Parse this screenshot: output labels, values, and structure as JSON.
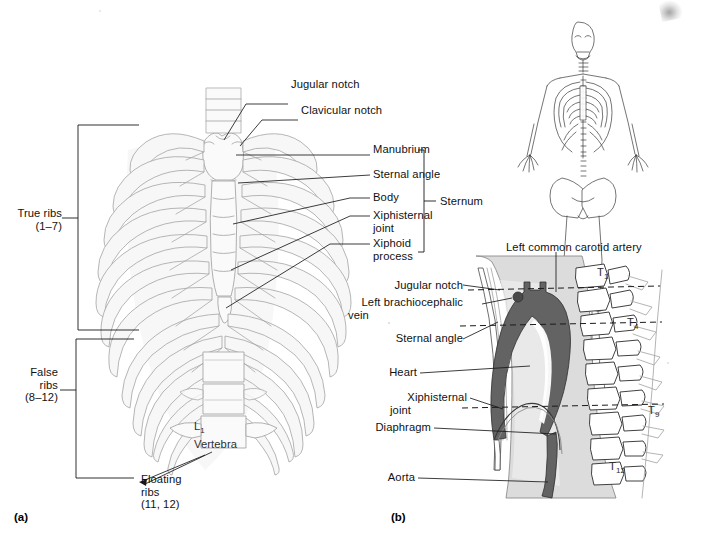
{
  "figure": {
    "panels": [
      {
        "id": "a",
        "label": "(a)",
        "caption": "Anterior view of the bony thorax"
      },
      {
        "id": "b",
        "label": "(b)",
        "caption": "Midsagittal section of the thorax"
      }
    ]
  },
  "panel_a": {
    "label": "(a)",
    "brackets": [
      {
        "name": "true-ribs",
        "label_line1": "True ribs",
        "label_line2": "(1–7)"
      },
      {
        "name": "false-ribs",
        "label_line1": "False",
        "label_line2": "ribs",
        "label_line3": "(8–12)"
      },
      {
        "name": "sternum",
        "label": "Sternum"
      }
    ],
    "callouts": [
      {
        "name": "jugular-notch",
        "text": "Jugular notch"
      },
      {
        "name": "clavicular-notch",
        "text": "Clavicular notch"
      },
      {
        "name": "manubrium",
        "text": "Manubrium"
      },
      {
        "name": "sternal-angle",
        "text": "Sternal angle"
      },
      {
        "name": "body",
        "text": "Body"
      },
      {
        "name": "xiphisternal-joint",
        "line1": "Xiphisternal",
        "line2": "joint"
      },
      {
        "name": "xiphoid-process",
        "line1": "Xiphoid",
        "line2": "process"
      },
      {
        "name": "floating-ribs",
        "line1": "Floating",
        "line2": "ribs",
        "line3": "(11, 12)"
      }
    ],
    "vertebra": {
      "name": "l1-vertebra",
      "symbol": "L",
      "subscript": "1",
      "word": "Vertebra"
    }
  },
  "panel_b": {
    "label": "(b)",
    "callouts": [
      {
        "name": "left-common-carotid-artery",
        "text": "Left common carotid artery"
      },
      {
        "name": "jugular-notch",
        "text": "Jugular notch"
      },
      {
        "name": "left-brachiocephalic-vein",
        "line1": "Left brachiocephalic",
        "line2": "vein"
      },
      {
        "name": "sternal-angle",
        "text": "Sternal angle"
      },
      {
        "name": "heart",
        "text": "Heart"
      },
      {
        "name": "xiphisternal-joint",
        "line1": "Xiphisternal",
        "line2": "joint"
      },
      {
        "name": "diaphragm",
        "text": "Diaphragm"
      },
      {
        "name": "aorta",
        "text": "Aorta"
      }
    ],
    "vertebrae": [
      {
        "name": "vertebra-t1",
        "symbol": "T",
        "subscript": "1"
      },
      {
        "name": "vertebra-t4",
        "symbol": "T",
        "subscript": "4"
      },
      {
        "name": "vertebra-t9",
        "symbol": "T",
        "subscript": "9"
      },
      {
        "name": "vertebra-t12",
        "symbol": "T",
        "subscript": "12"
      }
    ],
    "reference_lines": 3
  },
  "orientation_figure": {
    "name": "skeleton-orientation-figure",
    "view": "anterior full skeleton"
  },
  "colors": {
    "ink": "#111111",
    "bone_outline": "#9a9a9a",
    "bone_fill": "#f4f4f4",
    "soft_tissue": "#d9d9d9",
    "heart_aorta": "#636363",
    "background": "#ffffff"
  }
}
